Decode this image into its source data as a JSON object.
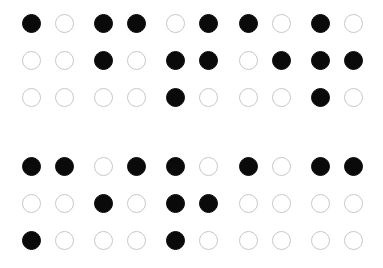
{
  "braille": {
    "dot_color_filled": "#0a0a0a",
    "dot_color_empty_stroke": "#c8c8c8",
    "column_x": [
      31,
      64,
      103,
      136,
      175,
      208,
      248,
      281,
      320,
      353
    ],
    "lines": [
      {
        "row_y": [
          23,
          60,
          97
        ],
        "cells": [
          {
            "dots": [
              1
            ]
          },
          {
            "dots": [
              1,
              2,
              4
            ]
          },
          {
            "dots": [
              2,
              3,
              4,
              5
            ]
          },
          {
            "dots": [
              1,
              5
            ]
          },
          {
            "dots": [
              1,
              2,
              3,
              5
            ]
          }
        ]
      },
      {
        "row_y": [
          166,
          203,
          240
        ],
        "cells": [
          {
            "dots": [
              1,
              3,
              4
            ]
          },
          {
            "dots": [
              2,
              4
            ]
          },
          {
            "dots": [
              1,
              2,
              3,
              5
            ]
          },
          {
            "dots": [
              1
            ]
          },
          {
            "dots": [
              1,
              4
            ]
          }
        ]
      }
    ]
  }
}
